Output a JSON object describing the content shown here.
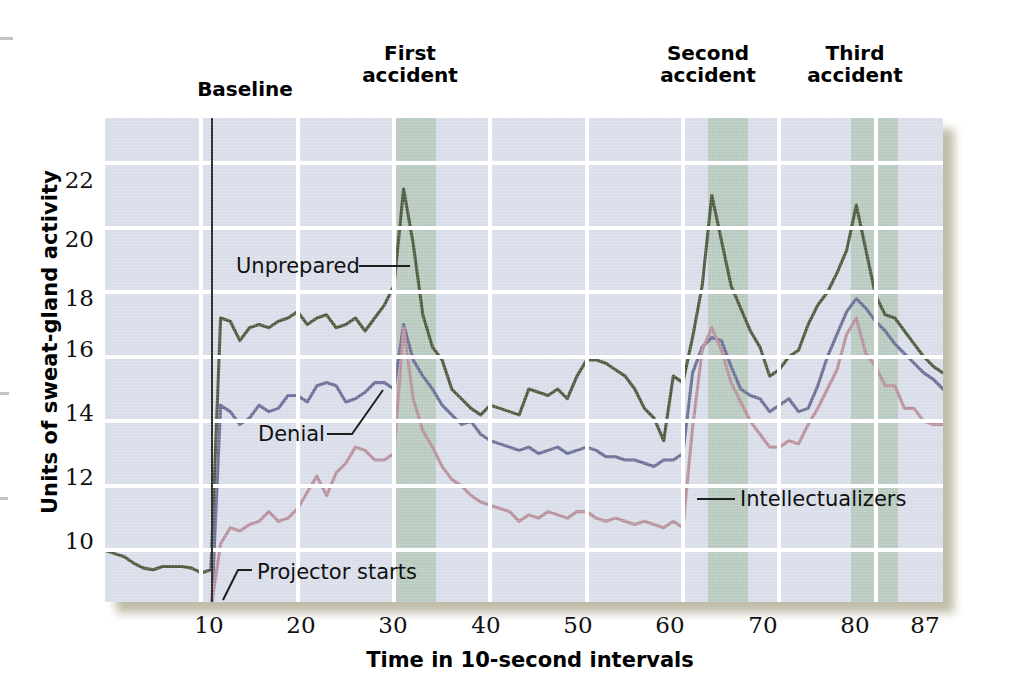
{
  "figure": {
    "y_axis_title": "Units of sweat-gland activity",
    "x_axis_title": "Time in 10-second intervals"
  },
  "annotations": {
    "baseline": "Baseline",
    "first_accident": "First\naccident",
    "second_accident": "Second\naccident",
    "third_accident": "Third\naccident",
    "projector_starts": "Projector starts"
  },
  "series_labels": {
    "unprepared": "Unprepared",
    "denial": "Denial",
    "intellectualizers": "Intellectualizers"
  },
  "colors": {
    "unprepared": "#4e5a3e",
    "denial": "#6b6f96",
    "intellectualizers": "#b8919c",
    "plot_background": "#d9dde9",
    "gridline": "#ffffff",
    "accident_band": "#a9c0ad",
    "baseline_rule": "#2b2b2b"
  },
  "axes": {
    "y_ticks": [
      "10",
      "12",
      "14",
      "16",
      "18",
      "20",
      "22"
    ],
    "x_ticks": [
      "10",
      "20",
      "30",
      "40",
      "50",
      "60",
      "70",
      "80",
      "87"
    ],
    "ylim": [
      8.4,
      23.4
    ],
    "xlim": [
      0,
      87
    ]
  },
  "chart_data": {
    "type": "line",
    "title": "",
    "xlabel": "Time in 10-second intervals",
    "ylabel": "Units of sweat-gland activity",
    "xlim": [
      0,
      87
    ],
    "ylim": [
      8.4,
      23.4
    ],
    "x_ticks": [
      10,
      20,
      30,
      40,
      50,
      60,
      70,
      80,
      87
    ],
    "y_ticks": [
      10,
      12,
      14,
      16,
      18,
      20,
      22
    ],
    "grid": true,
    "legend": "inline-callouts",
    "vertical_marker": {
      "label": "Projector starts",
      "x": 11
    },
    "shaded_regions": [
      {
        "label": "First accident",
        "x0": 30.2,
        "x1": 34.4
      },
      {
        "label": "Second accident",
        "x0": 62.6,
        "x1": 66.8
      },
      {
        "label": "Third accident",
        "x0": 77.4,
        "x1": 82.3
      }
    ],
    "x": [
      0,
      1,
      2,
      3,
      4,
      5,
      6,
      7,
      8,
      9,
      10,
      11,
      12,
      13,
      14,
      15,
      16,
      17,
      18,
      19,
      20,
      21,
      22,
      23,
      24,
      25,
      26,
      27,
      28,
      29,
      30,
      31,
      32,
      33,
      34,
      35,
      36,
      37,
      38,
      39,
      40,
      41,
      42,
      43,
      44,
      45,
      46,
      47,
      48,
      49,
      50,
      51,
      52,
      53,
      54,
      55,
      56,
      57,
      58,
      59,
      60,
      61,
      62,
      63,
      64,
      65,
      66,
      67,
      68,
      69,
      70,
      71,
      72,
      73,
      74,
      75,
      76,
      77,
      78,
      79,
      80,
      81,
      82,
      83,
      84,
      85,
      86,
      87
    ],
    "series": [
      {
        "name": "Unprepared",
        "color": "#4e5a3e",
        "values": [
          10.0,
          9.9,
          9.8,
          9.6,
          9.45,
          9.4,
          9.5,
          9.5,
          9.5,
          9.45,
          9.3,
          9.4,
          17.2,
          17.1,
          16.5,
          16.9,
          17.0,
          16.9,
          17.1,
          17.2,
          17.4,
          17.0,
          17.2,
          17.3,
          16.9,
          17.0,
          17.2,
          16.8,
          17.2,
          17.6,
          18.2,
          21.2,
          19.5,
          17.3,
          16.3,
          15.9,
          15.0,
          14.7,
          14.4,
          14.2,
          14.5,
          14.4,
          14.3,
          14.2,
          15.0,
          14.9,
          14.8,
          15.0,
          14.7,
          15.4,
          15.9,
          15.9,
          15.8,
          15.6,
          15.4,
          15.0,
          14.4,
          14.1,
          13.4,
          15.4,
          15.2,
          16.6,
          18.2,
          21.0,
          19.6,
          18.2,
          17.5,
          16.8,
          16.3,
          15.4,
          15.6,
          16.0,
          16.2,
          17.0,
          17.6,
          18.0,
          18.6,
          19.3,
          20.7,
          19.3,
          17.9,
          17.3,
          17.2,
          16.8,
          16.4,
          16.0,
          15.7,
          15.5
        ]
      },
      {
        "name": "Denial",
        "color": "#6b6f96",
        "values": [
          null,
          null,
          null,
          null,
          null,
          null,
          null,
          null,
          null,
          null,
          null,
          null,
          14.5,
          14.3,
          13.9,
          14.1,
          14.5,
          14.3,
          14.4,
          14.8,
          14.8,
          14.6,
          15.1,
          15.2,
          15.1,
          14.6,
          14.7,
          14.9,
          15.2,
          15.2,
          15.0,
          17.0,
          15.9,
          15.4,
          15.0,
          14.5,
          14.2,
          13.9,
          14.0,
          13.6,
          13.4,
          13.3,
          13.2,
          13.1,
          13.2,
          13.0,
          13.1,
          13.2,
          13.0,
          13.1,
          13.2,
          13.1,
          12.9,
          12.9,
          12.8,
          12.8,
          12.7,
          12.6,
          12.8,
          12.8,
          13.0,
          15.5,
          16.3,
          16.6,
          16.5,
          15.7,
          15.0,
          14.8,
          14.7,
          14.3,
          14.5,
          14.7,
          14.3,
          14.4,
          15.1,
          16.0,
          16.7,
          17.4,
          17.8,
          17.5,
          17.1,
          16.8,
          16.4,
          16.1,
          15.8,
          15.5,
          15.3,
          15.0
        ]
      },
      {
        "name": "Intellectualizers",
        "color": "#b8919c",
        "values": [
          null,
          null,
          null,
          null,
          null,
          null,
          null,
          null,
          null,
          null,
          null,
          null,
          10.2,
          10.7,
          10.6,
          10.8,
          10.9,
          11.2,
          10.9,
          11.0,
          11.3,
          11.8,
          12.3,
          11.7,
          12.4,
          12.7,
          13.2,
          13.1,
          12.8,
          12.8,
          13.0,
          16.9,
          14.7,
          13.7,
          13.2,
          12.6,
          12.2,
          12.0,
          11.7,
          11.5,
          11.4,
          11.3,
          11.2,
          10.9,
          11.1,
          11.0,
          11.2,
          11.1,
          11.0,
          11.2,
          11.2,
          11.0,
          10.9,
          11.0,
          10.9,
          10.8,
          10.9,
          10.8,
          10.7,
          10.9,
          10.7,
          13.8,
          16.2,
          16.9,
          16.2,
          15.2,
          14.6,
          14.0,
          13.6,
          13.2,
          13.2,
          13.4,
          13.3,
          13.9,
          14.4,
          15.0,
          15.6,
          16.7,
          17.2,
          16.1,
          15.7,
          15.1,
          15.1,
          14.4,
          14.4,
          14.0,
          13.9,
          13.9
        ]
      }
    ]
  }
}
